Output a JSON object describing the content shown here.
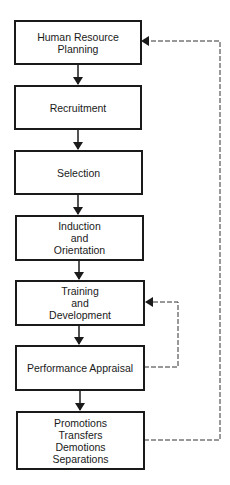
{
  "diagram": {
    "type": "flowchart",
    "colors": {
      "stroke": "#1a1a1a",
      "background": "#ffffff"
    },
    "nodes": [
      {
        "id": "hrp",
        "lines": [
          "Human Resource",
          "Planning"
        ]
      },
      {
        "id": "recruitment",
        "lines": [
          "Recruitment"
        ]
      },
      {
        "id": "selection",
        "lines": [
          "Selection"
        ]
      },
      {
        "id": "induction",
        "lines": [
          "Induction",
          "and",
          "Orientation"
        ]
      },
      {
        "id": "training",
        "lines": [
          "Training",
          "and",
          "Development"
        ]
      },
      {
        "id": "appraisal",
        "lines": [
          "Performance Appraisal"
        ]
      },
      {
        "id": "outcomes",
        "lines": [
          "Promotions",
          "Transfers",
          "Demotions",
          "Separations"
        ]
      }
    ],
    "edges": [
      {
        "from": "hrp",
        "to": "recruitment",
        "style": "solid"
      },
      {
        "from": "recruitment",
        "to": "selection",
        "style": "solid"
      },
      {
        "from": "selection",
        "to": "induction",
        "style": "solid"
      },
      {
        "from": "induction",
        "to": "training",
        "style": "solid"
      },
      {
        "from": "training",
        "to": "appraisal",
        "style": "solid"
      },
      {
        "from": "appraisal",
        "to": "outcomes",
        "style": "solid"
      },
      {
        "from": "appraisal",
        "to": "training",
        "style": "dashed"
      },
      {
        "from": "outcomes",
        "to": "hrp",
        "style": "dashed"
      }
    ]
  }
}
